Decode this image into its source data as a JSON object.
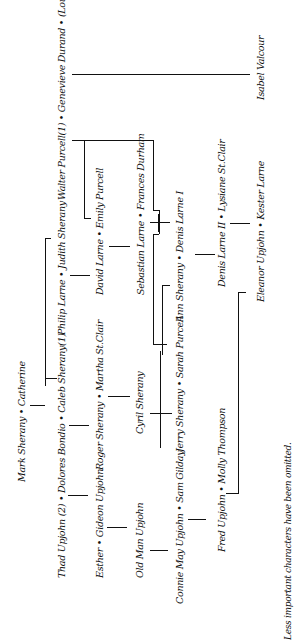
{
  "diagram": {
    "orientation": "rotated-90-ccw",
    "nodes": [
      {
        "id": "walter-genevieve-louis",
        "label": "Walter Purcell(1) • Genevieve Durand • (Louis Valcourt)"
      },
      {
        "id": "isabel",
        "label": "Isabel Valcour"
      },
      {
        "id": "philip-judith",
        "label": "Philip Larne • Judith Sherany"
      },
      {
        "id": "david-emily",
        "label": "David Larne • Emily Purcell"
      },
      {
        "id": "sebastian-frances",
        "label": "Sebastian Larne • Frances Durham"
      },
      {
        "id": "ann-denis1",
        "label": "Ann Sherany • Denis Larne I"
      },
      {
        "id": "denis2-lysiane",
        "label": "Denis Larne II • Lysiane St.Clair"
      },
      {
        "id": "eleanor-kester",
        "label": "Eleanor Upjohn • Kester Larne"
      },
      {
        "id": "mark-catherine",
        "label": "Mark Sherany • Catherine"
      },
      {
        "id": "thad-dolores-caleb",
        "label": "Thad Upjohn (2) • Dolores Bondio • Caleb Sherany(1)"
      },
      {
        "id": "esther-gideon",
        "label": "Esther • Gideon Upjohn"
      },
      {
        "id": "roger-martha",
        "label": "Roger Sherany • Martha St.Clair"
      },
      {
        "id": "old-man",
        "label": "Old Man Upjohn"
      },
      {
        "id": "cyril",
        "label": "Cyril Sherany"
      },
      {
        "id": "connie-sam",
        "label": "Connie May Upjohn • Sam Gilday"
      },
      {
        "id": "jerry-sarah",
        "label": "Jerry Sherany • Sarah Purcell"
      },
      {
        "id": "fred-molly",
        "label": "Fred Upjohn • Molly Thompson"
      }
    ],
    "note": "Less important characters have been omitted."
  }
}
